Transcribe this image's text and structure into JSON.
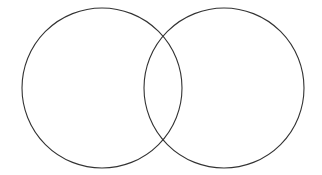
{
  "diagram": {
    "type": "venn",
    "sets": 2,
    "labels": [],
    "stroke_color": "#333333",
    "background_color": "#ffffff",
    "circles": [
      {
        "name": "left",
        "cx": 102,
        "cy": 88,
        "r": 80
      },
      {
        "name": "right",
        "cx": 224,
        "cy": 88,
        "r": 80
      }
    ]
  }
}
